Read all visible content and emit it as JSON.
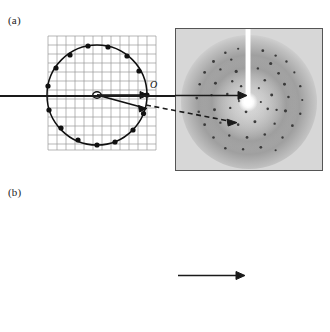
{
  "figure": {
    "caption_absent": true,
    "panels": [
      {
        "id": "a",
        "label": "(a)",
        "diagram": {
          "kind": "ewald-sphere-construction",
          "origin_label": "O",
          "center_label": "",
          "lattice_grids": 1,
          "grid_rotation_deg": [
            0
          ],
          "grid_cols": 13,
          "grid_rows": 13,
          "grid_spacing_px": 9,
          "circle_radius_px": 50,
          "reflection_count": 14,
          "incident_beam": "solid",
          "diffracted_beam": "dashed",
          "diffracted_beam_angle_deg": 14,
          "line_color": "#1a1a1a",
          "grid_color": "#9a9a9a"
        },
        "photo": {
          "kind": "x-ray-diffraction-pattern",
          "description": "still image, discrete spots",
          "beamstop": "vertical white arm with bright center",
          "spot_count": 150,
          "background": "#cfcfcf",
          "border_color": "#555555"
        }
      },
      {
        "id": "b",
        "label": "(b)",
        "diagram": {
          "kind": "ewald-sphere-construction-rotation",
          "origin_label": "O",
          "center_label": "C",
          "lattice_grids": 3,
          "grid_rotation_deg": [
            -8,
            0,
            8
          ],
          "grid_cols": 13,
          "grid_rows": 13,
          "grid_spacing_px": 9,
          "circle_radius_px": 52,
          "reflection_count": 46,
          "incident_beam": "solid",
          "diffracted_beam": "none",
          "line_color": "#1a1a1a",
          "grid_color": "#9a9a9a"
        },
        "photo": {
          "kind": "x-ray-diffraction-pattern",
          "description": "rotation image, dense spots in lunes",
          "beamstop": "vertical white arm with bright center",
          "spot_count": 260,
          "background": "#cfcfcf",
          "border_color": "#555555"
        }
      }
    ]
  },
  "colors": {
    "ink": "#1a1a1a",
    "grid": "#9a9a9a",
    "photo_bg": "#cfcfcf",
    "photo_border": "#555555",
    "page_bg": "#ffffff"
  }
}
